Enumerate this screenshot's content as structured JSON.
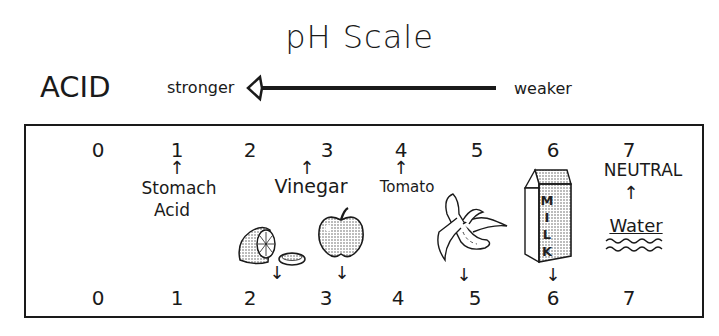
{
  "title": "pH Scale",
  "side_label": "ACID",
  "direction": {
    "strong_label": "stronger",
    "weak_label": "weaker"
  },
  "top_scale": [
    {
      "value": "0",
      "x": 98
    },
    {
      "value": "1",
      "x": 177
    },
    {
      "value": "2",
      "x": 250
    },
    {
      "value": "3",
      "x": 327
    },
    {
      "value": "4",
      "x": 401
    },
    {
      "value": "5",
      "x": 477
    },
    {
      "value": "6",
      "x": 553
    },
    {
      "value": "7",
      "x": 629
    }
  ],
  "bottom_scale": [
    {
      "value": "0",
      "x": 98
    },
    {
      "value": "1",
      "x": 177
    },
    {
      "value": "2",
      "x": 250
    },
    {
      "value": "3",
      "x": 326
    },
    {
      "value": "4",
      "x": 398
    },
    {
      "value": "5",
      "x": 475
    },
    {
      "value": "6",
      "x": 553
    },
    {
      "value": "7",
      "x": 629
    }
  ],
  "top_labels": {
    "stomach_acid": {
      "line1": "Stomach",
      "line2": "Acid",
      "ph": "1"
    },
    "vinegar": {
      "text": "Vinegar",
      "ph": "3"
    },
    "tomato": {
      "text": "Tomato",
      "ph": "4"
    },
    "neutral": {
      "text": "NEUTRAL",
      "ph": "7"
    },
    "water": {
      "text": "Water",
      "ph": "7"
    }
  },
  "illustrations": [
    {
      "name": "lemon",
      "ph": "2"
    },
    {
      "name": "apple",
      "ph": "3"
    },
    {
      "name": "banana",
      "ph": "5"
    },
    {
      "name": "milk",
      "ph": "6",
      "carton_text": [
        "M",
        "I",
        "L",
        "K"
      ]
    }
  ],
  "arrows": {
    "up": "↑",
    "down": "↓"
  }
}
